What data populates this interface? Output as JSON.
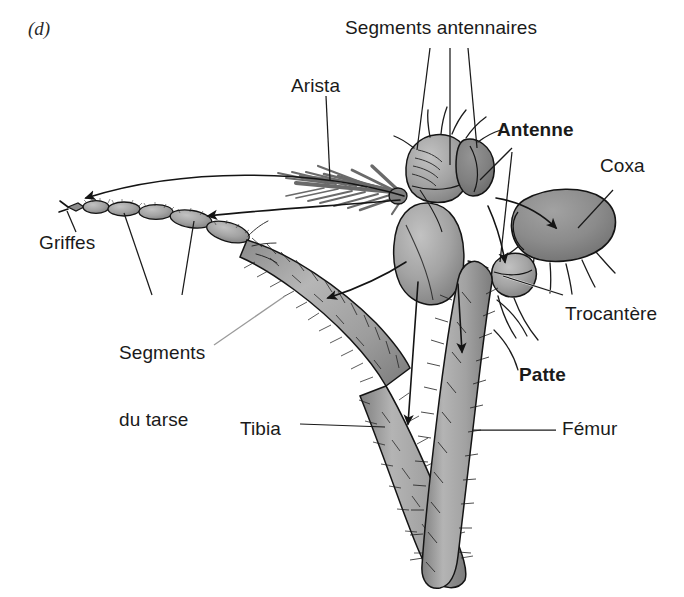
{
  "figure": {
    "panel_letter": "(d)",
    "background_color": "#ffffff",
    "ink_color": "#1a1a1a"
  },
  "labels": {
    "segments_antennaires": "Segments antennaires",
    "arista": "Arista",
    "antenne": "Antenne",
    "coxa": "Coxa",
    "griffes": "Griffes",
    "segments_du_tarse_line1": "Segments",
    "segments_du_tarse_line2": "du tarse",
    "trocantere": "Trocantère",
    "patte": "Patte",
    "tibia": "Tibia",
    "femur": "Fémur"
  },
  "palette": {
    "limb_light": "#b9b9b9",
    "limb_mid": "#a0a0a0",
    "limb_dark": "#8a8a8a",
    "coxa_dark": "#868686",
    "tarsus_gray": "#9a9a9a",
    "outline": "#141414",
    "leader_line": "#1a1a1a",
    "hair": "#1c1c1c"
  },
  "structures": [
    {
      "name": "arista",
      "description": "feathered bristle on antennal segment 3"
    },
    {
      "name": "antennal-segments",
      "description": "three antennal segments"
    },
    {
      "name": "antenne",
      "description": "whole antenna"
    },
    {
      "name": "coxa",
      "description": "basal leg segment"
    },
    {
      "name": "trocantere",
      "description": "trochanter, small joint segment"
    },
    {
      "name": "femur",
      "description": "thigh segment of the leg"
    },
    {
      "name": "tibia",
      "description": "shin segment of the leg"
    },
    {
      "name": "segments-du-tarse",
      "description": "tarsal segments"
    },
    {
      "name": "griffes",
      "description": "terminal claws"
    }
  ],
  "homology_arrows": [
    {
      "from": "arista",
      "to": "griffes"
    },
    {
      "from": "antennal-segment-3",
      "to": "tarsal-segments"
    },
    {
      "from": "antennal-segment-2",
      "to": "tibia"
    },
    {
      "from": "antennal-segment-1",
      "to": "femur"
    },
    {
      "from": "antennal-base",
      "to": "trochanter"
    },
    {
      "from": "head-base",
      "to": "coxa"
    }
  ]
}
